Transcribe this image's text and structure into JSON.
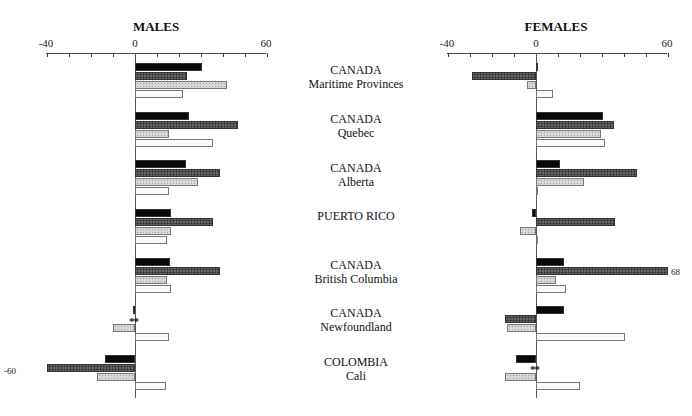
{
  "chart_data": [
    {
      "type": "bar",
      "orientation": "horizontal",
      "title": "MALES",
      "xlabel": "",
      "ylabel": "",
      "xlim": [
        -40,
        60
      ],
      "xticks": [
        -40,
        -30,
        -20,
        -10,
        0,
        10,
        20,
        30,
        40,
        50,
        60
      ],
      "xtick_labels_shown": [
        "-40",
        "0",
        "60"
      ],
      "grid": false,
      "legend": null,
      "categories": [
        "CANADA Maritime Provinces",
        "CANADA Quebec",
        "CANADA Alberta",
        "PUERTO RICO",
        "CANADA British Columbia",
        "CANADA Newfoundland",
        "COLOMBIA Cali"
      ],
      "series": [
        {
          "name": "series-1 (solid black)",
          "values": [
            30.5,
            24.5,
            23,
            16.5,
            16,
            -1,
            -13.5
          ]
        },
        {
          "name": "series-2 (dark hatched)",
          "values": [
            23.5,
            47,
            38.5,
            35.5,
            38.5,
            null,
            -60
          ]
        },
        {
          "name": "series-3 (light hatched)",
          "values": [
            42,
            15.5,
            28.5,
            16.5,
            14.5,
            -10,
            -17.5
          ]
        },
        {
          "name": "series-4 (white)",
          "values": [
            22,
            35.5,
            15.5,
            14.5,
            16.5,
            15.5,
            14
          ]
        }
      ],
      "annotations": [
        {
          "text": "-60",
          "target": "COLOMBIA Cali, series-2 (bar truncated at axis limit)"
        },
        {
          "text": "**",
          "target": "CANADA Newfoundland, series-2 (no data)"
        }
      ]
    },
    {
      "type": "bar",
      "orientation": "horizontal",
      "title": "FEMALES",
      "xlabel": "",
      "ylabel": "",
      "xlim": [
        -40,
        60
      ],
      "xticks": [
        -40,
        -30,
        -20,
        -10,
        0,
        10,
        20,
        30,
        40,
        50,
        60
      ],
      "xtick_labels_shown": [
        "-40",
        "0",
        "60"
      ],
      "grid": false,
      "legend": null,
      "categories": [
        "CANADA Maritime Provinces",
        "CANADA Quebec",
        "CANADA Alberta",
        "PUERTO RICO",
        "CANADA British Columbia",
        "CANADA Newfoundland",
        "COLOMBIA Cali"
      ],
      "series": [
        {
          "name": "series-1 (solid black)",
          "values": [
            0.5,
            30.5,
            11,
            -2,
            12.5,
            12.5,
            -9
          ]
        },
        {
          "name": "series-2 (dark hatched)",
          "values": [
            -29,
            35.5,
            46,
            36,
            68,
            -14,
            null
          ]
        },
        {
          "name": "series-3 (light hatched)",
          "values": [
            -4,
            29.5,
            22,
            -7.5,
            9,
            -13,
            -14
          ]
        },
        {
          "name": "series-4 (white)",
          "values": [
            7.5,
            31.5,
            0.5,
            0.5,
            13.5,
            40.5,
            20
          ]
        }
      ],
      "annotations": [
        {
          "text": "68",
          "target": "CANADA British Columbia, series-2 (bar truncated at axis limit)"
        },
        {
          "text": "**",
          "target": "COLOMBIA Cali, series-2 (no data)"
        }
      ]
    }
  ],
  "panels": {
    "males": {
      "title": "MALES",
      "tick_min": "-40",
      "tick_zero": "0",
      "tick_max": "60"
    },
    "females": {
      "title": "FEMALES",
      "tick_min": "-40",
      "tick_zero": "0",
      "tick_max": "60"
    }
  },
  "groups": [
    {
      "line1": "CANADA",
      "line2": "Maritime Provinces"
    },
    {
      "line1": "CANADA",
      "line2": "Quebec"
    },
    {
      "line1": "CANADA",
      "line2": "Alberta"
    },
    {
      "line1": "PUERTO RICO",
      "line2": ""
    },
    {
      "line1": "CANADA",
      "line2": "British Columbia"
    },
    {
      "line1": "CANADA",
      "line2": "Newfoundland"
    },
    {
      "line1": "COLOMBIA",
      "line2": "Cali"
    }
  ],
  "notes": {
    "males_cali_truncated": "-60",
    "females_bc_truncated": "68",
    "missing_marker": "**"
  }
}
